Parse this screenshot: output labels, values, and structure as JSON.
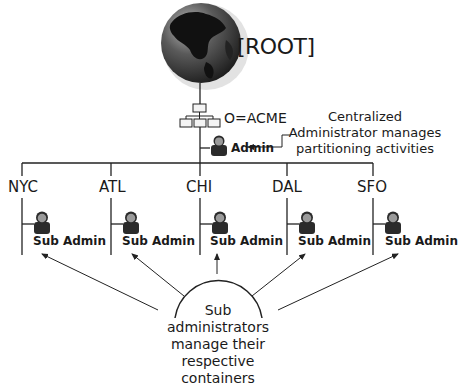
{
  "root": {
    "label": "[ROOT]"
  },
  "organization": {
    "label": "O=ACME"
  },
  "admin": {
    "label": "Admin"
  },
  "callout": {
    "line1": "Centralized",
    "line2": "Administrator manages",
    "line3": "partitioning activities"
  },
  "containers": [
    {
      "city": "NYC",
      "sub_label": "Sub Admin"
    },
    {
      "city": "ATL",
      "sub_label": "Sub Admin"
    },
    {
      "city": "CHI",
      "sub_label": "Sub Admin"
    },
    {
      "city": "DAL",
      "sub_label": "Sub Admin"
    },
    {
      "city": "SFO",
      "sub_label": "Sub Admin"
    }
  ],
  "dome": {
    "line1": "Sub",
    "line2": "administrators",
    "line3": "manage their",
    "line4": "respective",
    "line5": "containers"
  },
  "colors": {
    "line": "#222222",
    "globe_ocean": "#3a3a3a",
    "globe_land": "#111111",
    "person": "#2b2b2b",
    "face": "#9a9a9a"
  }
}
